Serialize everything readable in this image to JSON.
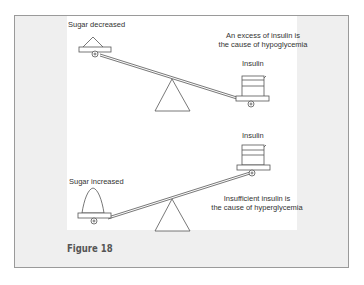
{
  "figure": {
    "caption": "Figure 18",
    "top_scale": {
      "left_label": "Sugar decreased",
      "right_label": "Insulin",
      "note_line1": "An excess of insulin is",
      "note_line2": "the cause of hypoglycemia"
    },
    "bottom_scale": {
      "left_label": "Sugar increased",
      "right_label": "Insulin",
      "note_line1": "Insufficient insulin is",
      "note_line2": "the cause of hyperglycemia"
    }
  },
  "colors": {
    "frame_bg": "#efefef",
    "frame_border": "#9a9a9a",
    "panel_bg": "#ffffff",
    "line": "#555555",
    "caption": "#555555"
  }
}
